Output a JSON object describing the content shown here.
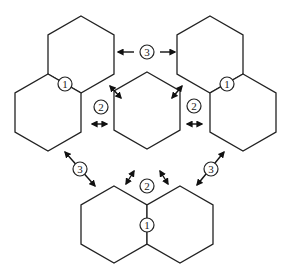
{
  "diagram": {
    "type": "hexagon-arrangement",
    "stroke_color": "#222222",
    "background": "#ffffff",
    "groups": [
      {
        "name": "top-left-pair",
        "hexes": 2,
        "badge": "1"
      },
      {
        "name": "top-right-pair",
        "hexes": 2,
        "badge": "1"
      },
      {
        "name": "center-hex",
        "hexes": 1
      },
      {
        "name": "bottom-pair",
        "hexes": 2,
        "badge": "1"
      }
    ],
    "labels": {
      "contact": "1",
      "near": "2",
      "far": "3"
    },
    "caption_cropped": ""
  }
}
